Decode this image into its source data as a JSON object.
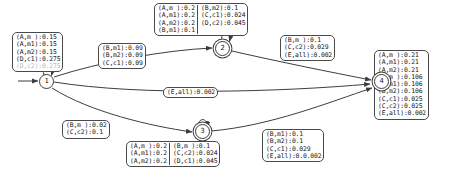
{
  "diagram": {
    "type": "finite-state-automaton",
    "nodes": [
      {
        "id": "n1",
        "label": "1",
        "accepting": false
      },
      {
        "id": "n2",
        "label": "2",
        "accepting": true
      },
      {
        "id": "n3",
        "label": "3",
        "accepting": true
      },
      {
        "id": "n4",
        "label": "4",
        "accepting": true
      }
    ],
    "labels": {
      "box_self1": {
        "rows": [
          "(A,m ):0.15",
          "(A,m1):0.15",
          "(A,m2):0.15",
          "(D,c1):0.275",
          "(D,c2):0.275"
        ]
      },
      "box_1to2": {
        "rows": [
          "(B,m1):0.09",
          "(B,m2):0.09",
          "(C,c1):0.09"
        ]
      },
      "box_self2_left": {
        "rows": [
          "(A,m ):0.2",
          "(A,m1):0.2",
          "(A,m2):0.2",
          "(B,m1):0.1"
        ]
      },
      "box_self2_right": {
        "rows": [
          "(B,m2):0.1",
          "(C,c1):0.024",
          "(D,c2):0.045"
        ]
      },
      "box_2to4": {
        "rows": [
          "(B,m ):0.1",
          "(C,c2):0.029",
          "(E,all):0.002"
        ]
      },
      "box_1to4": {
        "rows": [
          "(E,all):0.002"
        ]
      },
      "box_node4": {
        "rows": [
          "(A,m ):0.21",
          "(A,m1):0.21",
          "(A,m2):0.21",
          "(B,m ):0.106",
          "(B,m1):0.106",
          "(B,m2):0.106",
          "(C,c1):0.025",
          "(C,c2):0.025",
          "(E,all):0.002"
        ]
      },
      "box_1to3": {
        "rows": [
          "(B,m ):0.02",
          "(C,c2):0.1"
        ]
      },
      "box_self3_left": {
        "rows": [
          "(A,m ):0.2",
          "(A,m1):0.2",
          "(A,m2):0.2"
        ]
      },
      "box_self3_right": {
        "rows": [
          "(B,m ):0.1",
          "(C,c2):0.024",
          "(D,c1):0.045"
        ]
      },
      "box_3to4": {
        "rows": [
          "(B,m1):0.1",
          "(B,m2):0.1",
          "(C,c1):0.029",
          "(E,all):0.0.002"
        ]
      }
    },
    "colors": {
      "stroke": "#3d3d3d",
      "box_border": "#4a4a4a",
      "text": "#151515",
      "background": "#ffffff",
      "faded_text": "#b9b9b9"
    }
  }
}
